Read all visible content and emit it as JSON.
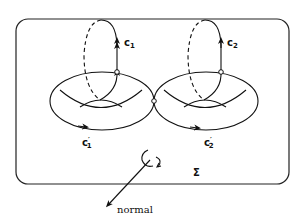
{
  "diagram": {
    "colors": {
      "stroke": "#111111",
      "background": "#ffffff"
    },
    "labels": {
      "c1": "c",
      "c1_sub": "1",
      "c2": "c",
      "c2_sub": "2",
      "c1p": "c",
      "c1p_sub": "1",
      "c1p_prime": "′",
      "c2p": "c",
      "c2p_sub": "2",
      "c2p_prime": "′",
      "sigma": "Σ",
      "normal": "normal"
    },
    "elements": {
      "frame": "rounded rectangle region Σ",
      "tori": [
        "left torus",
        "right torus"
      ],
      "cycles": [
        "c1 (meridian, left)",
        "c2 (meridian, right)",
        "c1' (longitude, left)",
        "c2' (longitude, right)"
      ],
      "normal_vector": "arrow pointing down-left with rotation indicator"
    }
  }
}
